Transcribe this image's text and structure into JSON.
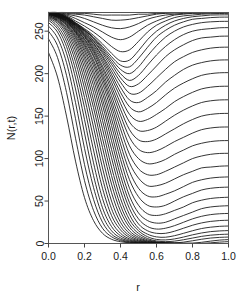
{
  "chart_data": {
    "type": "line",
    "title": "",
    "xlabel": "r",
    "ylabel": "N(r,t)",
    "xlim": [
      0,
      1.0
    ],
    "ylim": [
      0,
      272
    ],
    "grid": false,
    "legend": "none",
    "x_ticks": [
      "0.0",
      "0.2",
      "0.4",
      "0.6",
      "0.8",
      "1.0"
    ],
    "x_tick_values": [
      0.0,
      0.2,
      0.4,
      0.6,
      0.8,
      1.0
    ],
    "y_ticks": [
      "0",
      "50",
      "100",
      "150",
      "200",
      "250"
    ],
    "y_tick_values": [
      0,
      50,
      100,
      150,
      200,
      250
    ],
    "x": [
      0.0,
      0.05,
      0.1,
      0.15,
      0.2,
      0.25,
      0.3,
      0.35,
      0.4,
      0.45,
      0.5,
      0.55,
      0.6,
      0.65,
      0.7,
      0.75,
      0.8,
      0.85,
      0.9,
      0.95,
      1.0
    ],
    "series": [
      {
        "name": "t1",
        "values": [
          225,
          196,
          150,
          97,
          54,
          27,
          12,
          5,
          2.1,
          0.9,
          0.4,
          0.15,
          0.06,
          0.03,
          0.01,
          0.01,
          0,
          0,
          0,
          0,
          0
        ]
      },
      {
        "name": "t2",
        "values": [
          241,
          219,
          178,
          124,
          74,
          39,
          18,
          8,
          3.4,
          1.4,
          0.6,
          0.25,
          0.1,
          0.04,
          0.02,
          0.01,
          0,
          0,
          0,
          0,
          0
        ]
      },
      {
        "name": "t3",
        "values": [
          250,
          233,
          198,
          147,
          93,
          52,
          25,
          11,
          4.8,
          2.0,
          0.9,
          0.35,
          0.15,
          0.06,
          0.03,
          0.01,
          0,
          0,
          0,
          0,
          0
        ]
      },
      {
        "name": "t4",
        "values": [
          256,
          242,
          213,
          166,
          112,
          66,
          33,
          15,
          6.7,
          2.9,
          1.2,
          0.5,
          0.2,
          0.09,
          0.04,
          0.02,
          0.01,
          0,
          0,
          0,
          0
        ]
      },
      {
        "name": "t5",
        "values": [
          260,
          249,
          224,
          182,
          130,
          80,
          42,
          20,
          9.1,
          4.0,
          1.7,
          0.7,
          0.3,
          0.12,
          0.05,
          0.02,
          0.01,
          0,
          0,
          0,
          0
        ]
      },
      {
        "name": "t6",
        "values": [
          263,
          253,
          232,
          195,
          146,
          95,
          53,
          26,
          12,
          5.4,
          2.4,
          1.0,
          0.42,
          0.18,
          0.07,
          0.03,
          0.01,
          0,
          0,
          0,
          0
        ]
      },
      {
        "name": "t7",
        "values": [
          265,
          256,
          238,
          205,
          160,
          110,
          65,
          33,
          16,
          7.2,
          3.2,
          1.4,
          0.6,
          0.25,
          0.1,
          0.04,
          0.02,
          0.01,
          0,
          0,
          0
        ]
      },
      {
        "name": "t8",
        "values": [
          266,
          259,
          243,
          214,
          172,
          124,
          77,
          41,
          20,
          9.4,
          4.2,
          1.9,
          0.8,
          0.35,
          0.15,
          0.06,
          0.03,
          0.01,
          0,
          0,
          0
        ]
      },
      {
        "name": "t9",
        "values": [
          267,
          261,
          247,
          221,
          183,
          137,
          89,
          50,
          25,
          12,
          5.6,
          2.5,
          1.1,
          0.47,
          0.2,
          0.09,
          0.04,
          0.02,
          0.8,
          1.6,
          2.2
        ]
      },
      {
        "name": "t10",
        "values": [
          268,
          262,
          250,
          227,
          192,
          149,
          101,
          60,
          31,
          15,
          7.2,
          3.3,
          1.5,
          0.65,
          0.3,
          0.15,
          0.4,
          1.4,
          2.8,
          4.0,
          4.6
        ]
      },
      {
        "name": "t11",
        "values": [
          269,
          263,
          252,
          232,
          200,
          160,
          113,
          70,
          38,
          19,
          9.3,
          4.4,
          2.0,
          1.0,
          0.8,
          1.6,
          3.2,
          5.0,
          6.4,
          7.2,
          7.6
        ]
      },
      {
        "name": "t12",
        "values": [
          269,
          264,
          254,
          236,
          207,
          169,
          124,
          80,
          45,
          23,
          12,
          5.8,
          3.0,
          2.2,
          2.8,
          4.4,
          6.4,
          8.4,
          9.8,
          10.6,
          11.0
        ]
      },
      {
        "name": "t13",
        "values": [
          270,
          265,
          256,
          239,
          213,
          178,
          135,
          90,
          53,
          28,
          15,
          8.0,
          4.8,
          4.2,
          5.4,
          7.6,
          10.2,
          12.4,
          14.0,
          14.8,
          15.2
        ]
      },
      {
        "name": "t14",
        "values": [
          270,
          266,
          257,
          242,
          218,
          186,
          145,
          101,
          62,
          34,
          18,
          11,
          7.8,
          7.4,
          9.2,
          12.0,
          15.0,
          17.6,
          19.2,
          20.2,
          20.6
        ]
      },
      {
        "name": "t15",
        "values": [
          270,
          266,
          258,
          244,
          222,
          193,
          154,
          111,
          71,
          41,
          23,
          15,
          12,
          12,
          14.5,
          18,
          21.5,
          24.2,
          26.0,
          27.0,
          27.4
        ]
      },
      {
        "name": "t16",
        "values": [
          270,
          267,
          259,
          246,
          226,
          199,
          163,
          121,
          80,
          48,
          29,
          20,
          17,
          18,
          21,
          25,
          29,
          32,
          34,
          35,
          35.4
        ]
      },
      {
        "name": "t17",
        "values": [
          271,
          267,
          260,
          248,
          229,
          204,
          170,
          130,
          89,
          56,
          36,
          27,
          24,
          25,
          29,
          33,
          37,
          41,
          43,
          44,
          44.5
        ]
      },
      {
        "name": "t18",
        "values": [
          271,
          267,
          261,
          249,
          232,
          209,
          177,
          139,
          99,
          65,
          45,
          35,
          33,
          35,
          39,
          43,
          48,
          51,
          53,
          54,
          54.5
        ]
      },
      {
        "name": "t19",
        "values": [
          271,
          268,
          261,
          250,
          234,
          213,
          183,
          147,
          108,
          75,
          55,
          45,
          43,
          45,
          50,
          55,
          59,
          63,
          65,
          66,
          66.4
        ]
      },
      {
        "name": "t20",
        "values": [
          271,
          268,
          262,
          251,
          236,
          216,
          189,
          155,
          117,
          85,
          65,
          56,
          55,
          58,
          62,
          67,
          72,
          75,
          77,
          78,
          78.4
        ]
      },
      {
        "name": "t21",
        "values": [
          271,
          268,
          262,
          252,
          238,
          220,
          194,
          162,
          126,
          95,
          77,
          68,
          68,
          71,
          76,
          81,
          85,
          89,
          90,
          91,
          91.4
        ]
      },
      {
        "name": "t22",
        "values": [
          271,
          268,
          263,
          253,
          240,
          222,
          198,
          168,
          135,
          105,
          88,
          81,
          81,
          85,
          90,
          95,
          100,
          103,
          105,
          106,
          106.2
        ]
      },
      {
        "name": "t23",
        "values": [
          272,
          269,
          263,
          254,
          241,
          225,
          202,
          174,
          143,
          115,
          100,
          94,
          95,
          99,
          105,
          110,
          115,
          118,
          120,
          121,
          121.2
        ]
      },
      {
        "name": "t24",
        "values": [
          272,
          269,
          264,
          254,
          243,
          227,
          206,
          180,
          151,
          125,
          111,
          107,
          109,
          114,
          120,
          125,
          130,
          134,
          136,
          137,
          137.2
        ]
      },
      {
        "name": "t25",
        "values": [
          272,
          269,
          264,
          255,
          244,
          229,
          209,
          185,
          158,
          134,
          122,
          120,
          123,
          129,
          135,
          141,
          146,
          150,
          152,
          153,
          153.2
        ]
      },
      {
        "name": "t26",
        "values": [
          272,
          269,
          264,
          256,
          245,
          231,
          213,
          190,
          165,
          143,
          133,
          133,
          137,
          144,
          151,
          157,
          162,
          166,
          168,
          169,
          169.2
        ]
      },
      {
        "name": "t27",
        "values": [
          272,
          269,
          265,
          256,
          246,
          233,
          216,
          195,
          172,
          152,
          144,
          146,
          152,
          159,
          167,
          173,
          178,
          182,
          184,
          185,
          185.2
        ]
      },
      {
        "name": "t28",
        "values": [
          272,
          270,
          265,
          257,
          247,
          235,
          219,
          199,
          178,
          161,
          155,
          159,
          166,
          175,
          183,
          189,
          194,
          198,
          200,
          201,
          201.2
        ]
      },
      {
        "name": "t29",
        "values": [
          272,
          270,
          265,
          257,
          248,
          236,
          221,
          203,
          184,
          169,
          166,
          172,
          180,
          190,
          198,
          205,
          210,
          213,
          215,
          216,
          216.2
        ]
      },
      {
        "name": "t30",
        "values": [
          272,
          270,
          266,
          258,
          249,
          238,
          224,
          207,
          190,
          177,
          177,
          185,
          195,
          205,
          214,
          220,
          225,
          228,
          230,
          231,
          231.2
        ]
      },
      {
        "name": "t31",
        "values": [
          272,
          270,
          266,
          258,
          250,
          239,
          226,
          211,
          195,
          185,
          188,
          198,
          209,
          220,
          228,
          234,
          239,
          242,
          243,
          244,
          244.2
        ]
      },
      {
        "name": "t32",
        "values": [
          272,
          270,
          266,
          259,
          251,
          241,
          228,
          214,
          200,
          192,
          198,
          210,
          222,
          232,
          240,
          246,
          250,
          252,
          253,
          254,
          254.2
        ]
      },
      {
        "name": "t33",
        "values": [
          272,
          270,
          266,
          259,
          251,
          242,
          230,
          217,
          205,
          200,
          208,
          221,
          233,
          243,
          250,
          255,
          258,
          260,
          261,
          261.5,
          261.6
        ]
      },
      {
        "name": "t34",
        "values": [
          272,
          270,
          267,
          260,
          252,
          243,
          232,
          220,
          210,
          208,
          218,
          231,
          243,
          251,
          257,
          261,
          264,
          265,
          266,
          266.5,
          266.6
        ]
      },
      {
        "name": "t35",
        "values": [
          272,
          271,
          267,
          260,
          253,
          245,
          235,
          224,
          215,
          216,
          227,
          240,
          250,
          257,
          262,
          265,
          267,
          268,
          269,
          269.2,
          269.3
        ]
      },
      {
        "name": "t36",
        "values": [
          272,
          271,
          268,
          262,
          256,
          249,
          241,
          232,
          226,
          228,
          238,
          249,
          257,
          262,
          266,
          268,
          269,
          270,
          270.5,
          270.8,
          271
        ]
      },
      {
        "name": "t37",
        "values": [
          272,
          271,
          269,
          265,
          260,
          255,
          249,
          243,
          240,
          243,
          250,
          257,
          262,
          266,
          269,
          270,
          271,
          271,
          271.5,
          271.6,
          271.7
        ]
      },
      {
        "name": "t38",
        "values": [
          272,
          272,
          270,
          268,
          265,
          261,
          257,
          254,
          253,
          255,
          259,
          264,
          267,
          269,
          270,
          271,
          271.5,
          271.7,
          271.8,
          271.9,
          272
        ]
      },
      {
        "name": "t39",
        "values": [
          272,
          272,
          271,
          270,
          269,
          267,
          265,
          263,
          263,
          264,
          266,
          268,
          270,
          271,
          271.5,
          271.7,
          271.8,
          271.9,
          272,
          272,
          272
        ]
      },
      {
        "name": "t40",
        "values": [
          272,
          272,
          272,
          271,
          271,
          270,
          269,
          269,
          269,
          269,
          270,
          270,
          271,
          271.5,
          271.8,
          272,
          272,
          272,
          272,
          272,
          272
        ]
      }
    ]
  }
}
